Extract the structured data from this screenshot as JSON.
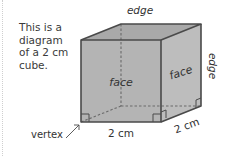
{
  "caption": {
    "lines": [
      "This is a",
      "diagram",
      "of a 2 cm",
      "cube."
    ]
  },
  "labels": {
    "top_edge": "edge",
    "right_edge": "edge",
    "front_face": "face",
    "side_face": "face",
    "vertex": "vertex",
    "bottom_length": "2 cm",
    "depth_length": "2 cm"
  },
  "colors": {
    "face_front": "#b4b4b4",
    "face_top": "#a9a9a9",
    "face_side": "#bdbdbd",
    "outline": "#4a4a4a",
    "hidden_edge": "#6a6a6a"
  }
}
